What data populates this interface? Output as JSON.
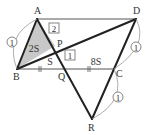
{
  "diagram": {
    "points": {
      "A": {
        "label": "A",
        "x": 37,
        "y": 19
      },
      "D": {
        "label": "D",
        "x": 136,
        "y": 19
      },
      "B": {
        "label": "B",
        "x": 17,
        "y": 69
      },
      "C": {
        "label": "C",
        "x": 114,
        "y": 69
      },
      "Q": {
        "label": "Q",
        "x": 66,
        "y": 69
      },
      "P": {
        "label": "P",
        "x": 55,
        "y": 46
      },
      "R": {
        "label": "R",
        "x": 92,
        "y": 119
      }
    },
    "area_labels": {
      "triangle_ABP": "2S",
      "triangle_BPQ": "S",
      "region_QC": "8S"
    },
    "ratio_labels": {
      "AP": "2",
      "PQ": "1",
      "AB": "1",
      "DC": "1",
      "CR": "1"
    },
    "colors": {
      "shade": "#c8c8c8",
      "line": "#222222",
      "thin_line": "#555555",
      "arc": "#999999"
    }
  }
}
